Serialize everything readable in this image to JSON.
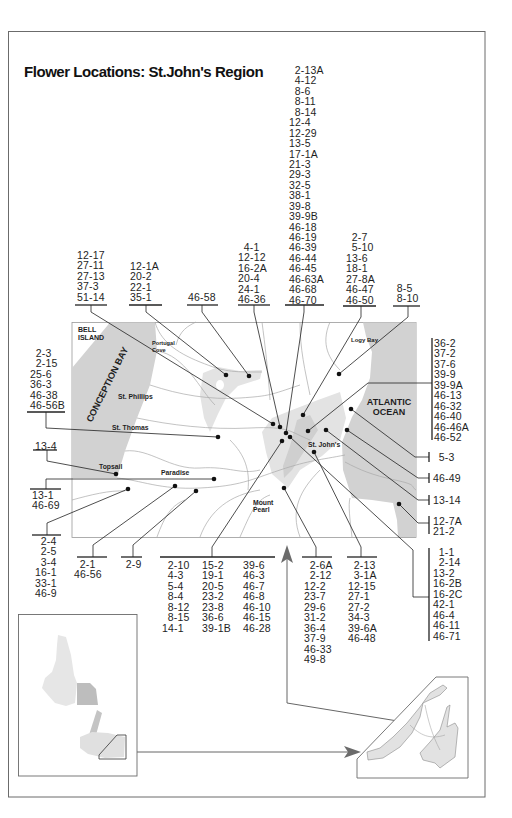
{
  "title": "Flower Locations: St.John's Region",
  "colors": {
    "water": "#d2d2d2",
    "urban": "#e3e3e3",
    "roads": "#a9a9a9",
    "lines": "#222222",
    "frame": "#6b6b6b"
  },
  "map_labels": {
    "bell_island_1": "BELL",
    "bell_island_2": "ISLAND",
    "portugal_cove_1": "Portugal",
    "portugal_cove_2": "Cove",
    "conception_bay": "CONCEPTION BAY",
    "st_phillips": "St. Phillips",
    "st_thomas": "St. Thomas",
    "topsail": "Topsail",
    "paradise": "Paradise",
    "mount_pearl_1": "Mount",
    "mount_pearl_2": "Pearl",
    "st_johns": "St. John's",
    "logy_bay": "Logy Bay",
    "atlantic_1": "ATLANTIC",
    "atlantic_2": "OCEAN"
  },
  "groups": {
    "g01": {
      "items": [
        "12-17",
        "27-11",
        "27-13",
        "37-3",
        "51-14"
      ]
    },
    "g02": {
      "items": [
        "12-1A",
        "20-2",
        "22-1",
        "35-1"
      ]
    },
    "g03": {
      "items": [
        "46-58"
      ]
    },
    "g04": {
      "items": [
        "4-1",
        "12-12",
        "16-2A",
        "20-4",
        "24-1",
        "46-36"
      ]
    },
    "g05": {
      "items": [
        "2-13A",
        "4-12",
        "8-6",
        "8-11",
        "8-14",
        "12-4",
        "12-29",
        "13-5",
        "17-1A",
        "21-3",
        "29-3",
        "32-5",
        "38-1",
        "39-8",
        "39-9B",
        "46-18",
        "46-19",
        "46-39",
        "46-44",
        "46-45",
        "46-63A",
        "46-68",
        "46-70"
      ]
    },
    "g06": {
      "items": [
        "2-7",
        "5-10",
        "13-6",
        "18-1",
        "27-8A",
        "46-47",
        "46-50"
      ]
    },
    "g07": {
      "items": [
        "8-5",
        "8-10"
      ]
    },
    "g08": {
      "items": [
        "2-3",
        "2-15",
        "25-6",
        "36-3",
        "46-38",
        "46-56B"
      ]
    },
    "g09": {
      "items": [
        "13-4"
      ]
    },
    "g10": {
      "items": [
        "13-1",
        "46-69"
      ]
    },
    "g11": {
      "items": [
        "2-4",
        "2-5",
        "3-4",
        "16-1",
        "33-1",
        "46-9"
      ]
    },
    "g12": {
      "items": [
        "2-1",
        "46-56"
      ]
    },
    "g13": {
      "items": [
        "2-9"
      ]
    },
    "g14": {
      "columns": [
        [
          "2-10",
          "4-3",
          "5-4",
          "8-4",
          "8-12",
          "8-15",
          "14-1"
        ],
        [
          "15-2",
          "19-1",
          "20-5",
          "23-2",
          "23-8",
          "36-6",
          "39-1B"
        ],
        [
          "39-6",
          "46-3",
          "46-7",
          "46-8",
          "46-10",
          "46-15",
          "46-28"
        ]
      ]
    },
    "g15": {
      "items": [
        "2-6A",
        "2-12",
        "12-2",
        "23-7",
        "29-6",
        "31-2",
        "36-4",
        "37-9",
        "46-33",
        "49-8"
      ]
    },
    "g16": {
      "items": [
        "2-13",
        "3-1A",
        "12-15",
        "27-1",
        "27-2",
        "34-3",
        "39-6A",
        "46-48"
      ]
    },
    "g17": {
      "items": [
        "36-2",
        "37-2",
        "37-6",
        "39-9",
        "39-9A",
        "46-13",
        "46-32",
        "46-40",
        "46-46A",
        "46-52"
      ]
    },
    "g18": {
      "items": [
        "5-3"
      ]
    },
    "g19": {
      "items": [
        "46-49"
      ]
    },
    "g20": {
      "items": [
        "13-14"
      ]
    },
    "g21": {
      "items": [
        "12-7A",
        "21-2"
      ]
    },
    "g22": {
      "items": [
        "1-1",
        "2-14",
        "13-2",
        "16-2B",
        "16-2C",
        "42-1",
        "46-4",
        "46-11",
        "46-71"
      ]
    }
  }
}
